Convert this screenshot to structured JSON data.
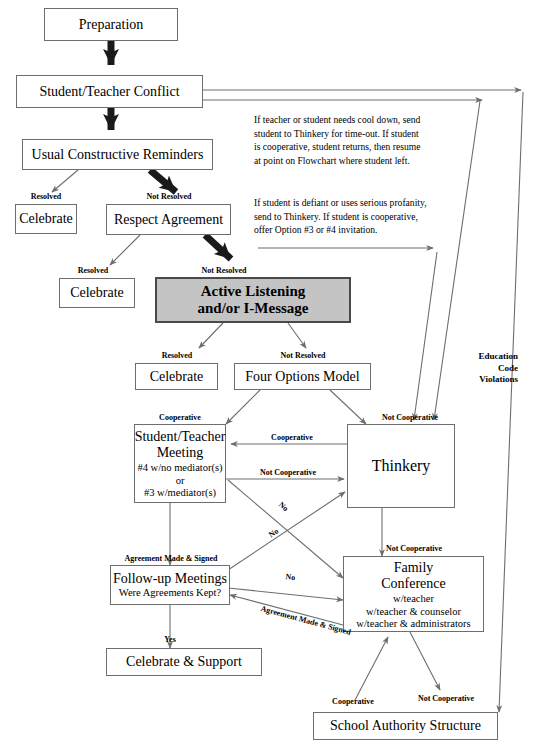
{
  "colors": {
    "line": "#6e6e6e",
    "thick_arrow": "#1a1a1a",
    "emphasis_fill": "#c4c4c4",
    "emphasis_border": "#4a4a4a",
    "text": "#000000",
    "background": "#ffffff"
  },
  "nodes": [
    {
      "id": "preparation",
      "label": "Preparation",
      "sub": ""
    },
    {
      "id": "conflict",
      "label": "Student/Teacher Conflict",
      "sub": ""
    },
    {
      "id": "reminders",
      "label": "Usual Constructive Reminders",
      "sub": ""
    },
    {
      "id": "celebrate1",
      "label": "Celebrate",
      "sub": ""
    },
    {
      "id": "respect",
      "label": "Respect Agreement",
      "sub": ""
    },
    {
      "id": "celebrate2",
      "label": "Celebrate",
      "sub": ""
    },
    {
      "id": "active-listening",
      "label": "Active Listening\nand/or I-Message",
      "sub": ""
    },
    {
      "id": "celebrate3",
      "label": "Celebrate",
      "sub": ""
    },
    {
      "id": "four-options",
      "label": "Four Options Model",
      "sub": ""
    },
    {
      "id": "st-meeting",
      "label": "Student/Teacher\nMeeting",
      "sub": "#4 w/no mediator(s)\nor\n#3 w/mediator(s)"
    },
    {
      "id": "thinkery",
      "label": "Thinkery",
      "sub": ""
    },
    {
      "id": "followup",
      "label": "Follow-up Meetings",
      "sub": "Were Agreements Kept?"
    },
    {
      "id": "family-conference",
      "label": "Family\nConference",
      "sub": "w/teacher\nw/teacher & counselor\nw/teacher & administrators"
    },
    {
      "id": "celebrate-support",
      "label": "Celebrate & Support",
      "sub": ""
    },
    {
      "id": "school-authority",
      "label": "School Authority Structure",
      "sub": ""
    }
  ],
  "edge_labels": [
    {
      "id": "reminders-resolved",
      "text": "Resolved"
    },
    {
      "id": "reminders-not-resolved",
      "text": "Not Resolved"
    },
    {
      "id": "respect-resolved",
      "text": "Resolved"
    },
    {
      "id": "respect-not-resolved",
      "text": "Not Resolved"
    },
    {
      "id": "al-resolved",
      "text": "Resolved"
    },
    {
      "id": "al-not-resolved",
      "text": "Not Resolved"
    },
    {
      "id": "fo-cooperative",
      "text": "Cooperative"
    },
    {
      "id": "fo-not-cooperative",
      "text": "Not Cooperative"
    },
    {
      "id": "thinkery-cooperative",
      "text": "Cooperative"
    },
    {
      "id": "meeting-not-cooperative",
      "text": "Not Cooperative"
    },
    {
      "id": "agreement-made-signed",
      "text": "Agreement Made & Signed"
    },
    {
      "id": "thinkery-not-cooperative",
      "text": "Not Cooperative"
    },
    {
      "id": "no-1",
      "text": "No"
    },
    {
      "id": "no-2",
      "text": "No"
    },
    {
      "id": "no-3",
      "text": "No"
    },
    {
      "id": "agreement-made-signed-2",
      "text": "Agreement Made\n& Signed"
    },
    {
      "id": "followup-yes",
      "text": "Yes"
    },
    {
      "id": "fc-cooperative",
      "text": "Cooperative"
    },
    {
      "id": "fc-not-cooperative",
      "text": "Not\nCooperative"
    }
  ],
  "notes": [
    {
      "id": "cool-down-note",
      "text": "If teacher or student needs cool down, send\nstudent to Thinkery for time-out. If student\nis cooperative, student returns, then resume\nat point on Flowchart where student left."
    },
    {
      "id": "defiant-note",
      "text": "If student is defiant or uses serious profanity,\nsend to Thinkery.  If student is cooperative,\noffer Option #3 or #4 invitation."
    }
  ],
  "side_labels": [
    {
      "id": "education-code-violations",
      "text": "Education\nCode\nViolations"
    }
  ]
}
